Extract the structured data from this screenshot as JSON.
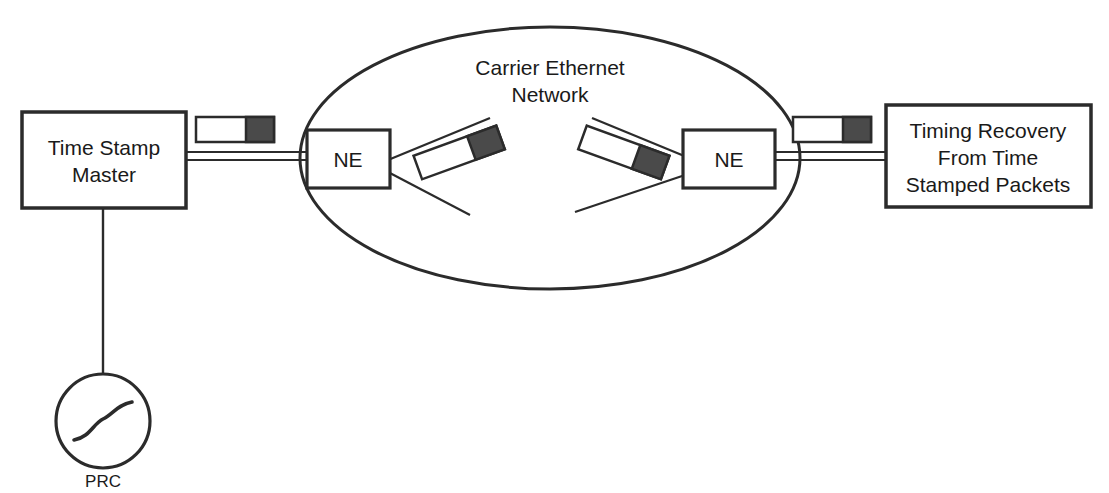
{
  "diagram": {
    "colors": {
      "line": "#2b2b2b",
      "packet_payload": "#4a4a4a",
      "packet_header": "#ffffff",
      "background": "#ffffff"
    },
    "nodes": {
      "master": {
        "label_line1": "Time Stamp",
        "label_line2": "Master"
      },
      "prc": {
        "label": "PRC",
        "symbol": "sine-wave"
      },
      "network": {
        "label_line1": "Carrier Ethernet",
        "label_line2": "Network"
      },
      "ne_left": {
        "label": "NE"
      },
      "ne_right": {
        "label": "NE"
      },
      "slave": {
        "label_line1": "Timing Recovery",
        "label_line2": "From Time",
        "label_line3": "Stamped Packets"
      }
    },
    "packets": [
      {
        "name": "packet-master-egress",
        "rotation": 0
      },
      {
        "name": "packet-network-left",
        "rotation": -20
      },
      {
        "name": "packet-network-right",
        "rotation": 20
      },
      {
        "name": "packet-slave-ingress",
        "rotation": 0
      }
    ]
  }
}
